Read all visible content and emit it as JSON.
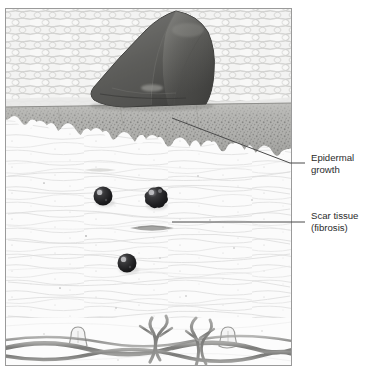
{
  "figure": {
    "kind": "histological-illustration",
    "panel": {
      "x": 5,
      "y": 8,
      "width": 287,
      "height": 358
    },
    "background_color": "#ffffff",
    "border_color": "#9a9a9a"
  },
  "layers": [
    {
      "id": "stratum-corneum",
      "name": "Stratum corneum basket-weave band",
      "top": 8,
      "bottom": 108,
      "base_color": "#efefee",
      "weave_color": "#b9b9b7",
      "description": "Lattice of overlapping flattened keratinocyte plates"
    },
    {
      "id": "epidermis",
      "name": "Epidermal growth layer",
      "top": 108,
      "bottom": 168,
      "base_color": "#b3b3b0",
      "stipple_color": "#7c7c79",
      "description": "Granular stippled epidermal tongue with wavy rete-ridge lower border"
    },
    {
      "id": "scar-dermis",
      "name": "Scar tissue (fibrosis) dermis",
      "top": 145,
      "bottom": 318,
      "base_color": "#fafafa",
      "fiber_color": "#cfcfcd",
      "description": "Pale fibrotic dermis with faint horizontal collagen striations"
    },
    {
      "id": "deep-fiber-band",
      "name": "Deep collagen fiber bundles",
      "top": 318,
      "bottom": 366,
      "base_color": "#fcfcfc",
      "fiber_color": "#8e8e8c",
      "description": "Interwoven wavy collagen bundles with bulbous structures"
    }
  ],
  "scab": {
    "id": "scab",
    "name": "Scab / crust over wound",
    "fill_dark": "#4e4e4c",
    "fill_mid": "#6e6e6b",
    "fill_light": "#8b8b87",
    "outline": "#3a3a38",
    "bounds": {
      "x": 88,
      "y": 10,
      "width": 128,
      "height": 98
    }
  },
  "cells": [
    {
      "id": "cell-1",
      "name": "dermal-cell-nucleus",
      "cx": 103,
      "cy": 196,
      "r": 9.5,
      "fill": "#1f1f20",
      "highlight": "#b8b8ba"
    },
    {
      "id": "cell-2",
      "name": "dermal-cell-nucleus",
      "cx": 155,
      "cy": 198,
      "r": 10.5,
      "fill": "#2a2a2b",
      "highlight": "#c6c6c8"
    },
    {
      "id": "cell-3",
      "name": "dermal-cell-nucleus",
      "cx": 127,
      "cy": 263,
      "r": 9.5,
      "fill": "#232324",
      "highlight": "#bcbcbe"
    }
  ],
  "spindle_cell": {
    "id": "spindle-fibroblast",
    "name": "fibroblast-spindle",
    "cx": 152,
    "cy": 228,
    "width": 44,
    "height": 7,
    "fill": "#9b9b99"
  },
  "callouts": [
    {
      "id": "callout-epidermal-growth",
      "label_line_1": "Epidermal",
      "label_line_2": "growth",
      "text_x": 311,
      "text_y": 161,
      "line_color": "#4a4a4a",
      "leader": {
        "type": "elbow",
        "points": "305,163 290,163 172,118"
      }
    },
    {
      "id": "callout-scar-tissue",
      "label_line_1": "Scar tissue",
      "label_line_2": "(fibrosis)",
      "text_x": 311,
      "text_y": 219,
      "line_color": "#4a4a4a",
      "leader": {
        "type": "straight",
        "points": "305,222 172,222"
      }
    }
  ],
  "text_style": {
    "color": "#2b2b2b",
    "font_size_px": 9.6,
    "line_height_px": 12
  }
}
